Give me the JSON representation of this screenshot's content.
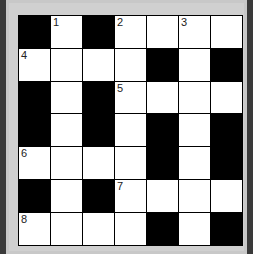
{
  "puzzle": {
    "rows": 7,
    "cols": 7,
    "grid": [
      [
        "B",
        "W",
        "B",
        "W",
        "W",
        "W",
        "W"
      ],
      [
        "W",
        "W",
        "W",
        "W",
        "B",
        "W",
        "B"
      ],
      [
        "B",
        "W",
        "B",
        "W",
        "W",
        "W",
        "W"
      ],
      [
        "B",
        "W",
        "B",
        "W",
        "B",
        "W",
        "B"
      ],
      [
        "W",
        "W",
        "W",
        "W",
        "B",
        "W",
        "B"
      ],
      [
        "B",
        "W",
        "B",
        "W",
        "W",
        "W",
        "W"
      ],
      [
        "W",
        "W",
        "W",
        "W",
        "B",
        "W",
        "B"
      ]
    ],
    "numbers": [
      {
        "row": 0,
        "col": 1,
        "n": "1"
      },
      {
        "row": 0,
        "col": 3,
        "n": "2"
      },
      {
        "row": 0,
        "col": 5,
        "n": "3"
      },
      {
        "row": 1,
        "col": 0,
        "n": "4"
      },
      {
        "row": 2,
        "col": 3,
        "n": "5"
      },
      {
        "row": 4,
        "col": 0,
        "n": "6"
      },
      {
        "row": 5,
        "col": 3,
        "n": "7"
      },
      {
        "row": 6,
        "col": 0,
        "n": "8"
      }
    ]
  },
  "colors": {
    "black_cell": "#000000",
    "white_cell": "#ffffff",
    "frame": "#c8c8c8",
    "side_strip": "#3a3a3a"
  }
}
